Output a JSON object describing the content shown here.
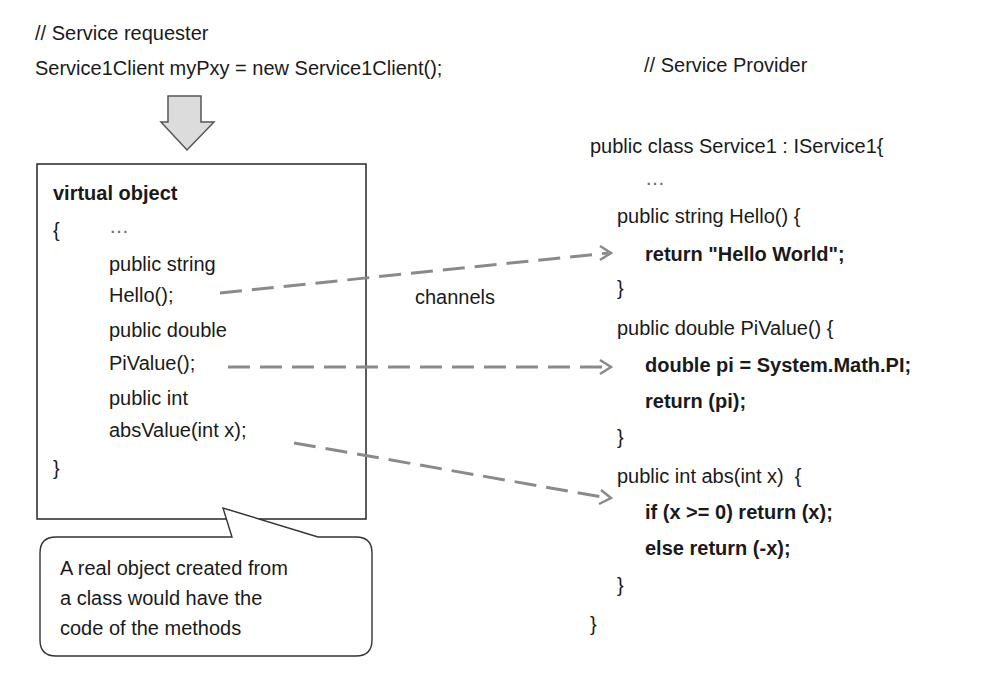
{
  "requester": {
    "comment": "// Service requester",
    "statement": "Service1Client myPxy = new Service1Client();"
  },
  "virtual_object": {
    "title": "virtual object",
    "open_brace": "{",
    "ellipsis": "…",
    "lines": [
      "public string",
      "Hello();",
      "public double",
      "PiValue();",
      "public int",
      "absValue(int x);"
    ],
    "close_brace": "}"
  },
  "channels_label": "channels",
  "callout": {
    "lines": [
      "A real object created from",
      "a class would have the",
      "code of the methods"
    ]
  },
  "provider": {
    "comment": "// Service Provider",
    "class_decl": "public class Service1 : IService1{",
    "ellipsis": "…",
    "methods": [
      {
        "signature": "public string Hello() {",
        "body": [
          "return \"Hello World\";"
        ],
        "close": "}"
      },
      {
        "signature": "public double PiValue() {",
        "body": [
          "double pi = System.Math.PI;",
          "return (pi);"
        ],
        "close": "}"
      },
      {
        "signature": "public int abs(int x)  {",
        "body": [
          "if (x >= 0) return (x);",
          "else return (-x);"
        ],
        "close": "}"
      }
    ],
    "class_close": "}"
  },
  "colors": {
    "text": "#1a1a1a",
    "box_border": "#333333",
    "dashed_arrow": "#8a8a8a",
    "down_arrow_fill": "#dcdcdc",
    "down_arrow_stroke": "#555555"
  }
}
